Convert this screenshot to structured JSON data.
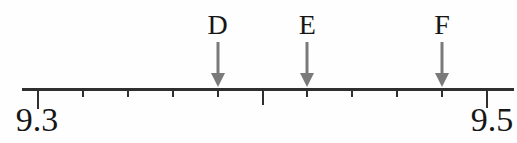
{
  "figure": {
    "background_color": "#fefefe",
    "axis_color": "#2f2f2f",
    "tick_color": "#2f2f2f",
    "arrow_color": "#7a7a7a",
    "label_color": "#161616"
  },
  "chart_data": {
    "type": "number_line",
    "axis_min": 9.3,
    "axis_max": 9.5,
    "tick_step": 0.02,
    "major_tick_values": [
      9.3,
      9.4,
      9.5
    ],
    "axis_min_label": "9.3",
    "axis_max_label": "9.5",
    "points": [
      {
        "label": "D",
        "value": 9.38
      },
      {
        "label": "E",
        "value": 9.42
      },
      {
        "label": "F",
        "value": 9.48
      }
    ]
  }
}
